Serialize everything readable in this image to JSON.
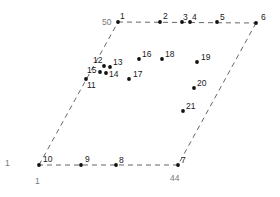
{
  "diagram": {
    "type": "parallelogram-point-layout",
    "corner_labels": [
      {
        "id": "top-left-value",
        "text": "50",
        "x": 102,
        "y": 25
      },
      {
        "id": "left-value",
        "text": "1",
        "x": 5,
        "y": 166
      },
      {
        "id": "bottom-left-value",
        "text": "1",
        "x": 35,
        "y": 184
      },
      {
        "id": "bottom-right-value",
        "text": "44",
        "x": 170,
        "y": 181
      }
    ],
    "edges": [
      {
        "from": 1,
        "to": 6
      },
      {
        "from": 6,
        "to": 7
      },
      {
        "from": 7,
        "to": 10
      },
      {
        "from": 10,
        "to": 1
      }
    ],
    "points": [
      {
        "id": "1",
        "x": 118,
        "y": 22,
        "lx": 2,
        "ly": -3
      },
      {
        "id": "2",
        "x": 160,
        "y": 22,
        "lx": 3,
        "ly": -3
      },
      {
        "id": "3",
        "x": 182,
        "y": 22,
        "lx": 1,
        "ly": -2
      },
      {
        "id": "4",
        "x": 190,
        "y": 22,
        "lx": 2,
        "ly": -2
      },
      {
        "id": "5",
        "x": 217,
        "y": 22,
        "lx": 3,
        "ly": -2
      },
      {
        "id": "6",
        "x": 256,
        "y": 23,
        "lx": 5,
        "ly": -3
      },
      {
        "id": "7",
        "x": 178,
        "y": 165,
        "lx": 3,
        "ly": -2
      },
      {
        "id": "8",
        "x": 116,
        "y": 165,
        "lx": 3,
        "ly": -2
      },
      {
        "id": "9",
        "x": 81,
        "y": 165,
        "lx": 4,
        "ly": -3
      },
      {
        "id": "10",
        "x": 39,
        "y": 165,
        "lx": 4,
        "ly": -3
      },
      {
        "id": "11",
        "x": 86,
        "y": 79,
        "lx": 1,
        "ly": 9
      },
      {
        "id": "12",
        "x": 104,
        "y": 66,
        "lx": -11,
        "ly": -3
      },
      {
        "id": "13",
        "x": 110,
        "y": 67,
        "lx": 3,
        "ly": -2
      },
      {
        "id": "14",
        "x": 106,
        "y": 73,
        "lx": 3,
        "ly": 4
      },
      {
        "id": "15",
        "x": 100,
        "y": 72,
        "lx": -13,
        "ly": 1
      },
      {
        "id": "16",
        "x": 139,
        "y": 59,
        "lx": 3,
        "ly": -2
      },
      {
        "id": "17",
        "x": 129,
        "y": 79,
        "lx": 4,
        "ly": -2
      },
      {
        "id": "18",
        "x": 162,
        "y": 59,
        "lx": 3,
        "ly": -2
      },
      {
        "id": "19",
        "x": 197,
        "y": 62,
        "lx": 4,
        "ly": -2
      },
      {
        "id": "20",
        "x": 194,
        "y": 88,
        "lx": 3,
        "ly": -2
      },
      {
        "id": "21",
        "x": 183,
        "y": 111,
        "lx": 3,
        "ly": -2
      }
    ],
    "colors": {
      "point": "#111111",
      "edge": "#555555",
      "label": "#1a1a1a",
      "axis_label": "#777777"
    }
  }
}
